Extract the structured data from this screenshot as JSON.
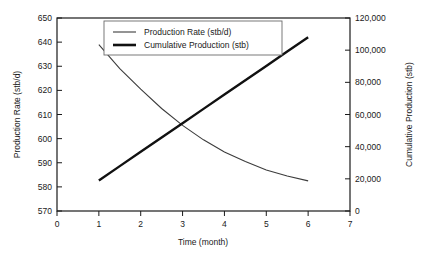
{
  "chart_data": {
    "type": "line",
    "title": "",
    "xlabel": "Time (month)",
    "ylabel": "Production Rate (stb/d)",
    "y2label": "Cumulative Production (stb)",
    "xlim": [
      0,
      7
    ],
    "ylim": [
      570,
      650
    ],
    "y2lim": [
      0,
      120000
    ],
    "grid": false,
    "legend_position": "top-center",
    "xticks": [
      "0",
      "1",
      "2",
      "3",
      "4",
      "5",
      "6",
      "7"
    ],
    "xtick_values": [
      0,
      1,
      2,
      3,
      4,
      5,
      6,
      7
    ],
    "yticks": [
      "570",
      "580",
      "590",
      "600",
      "610",
      "620",
      "630",
      "640",
      "650"
    ],
    "ytick_values": [
      570,
      580,
      590,
      600,
      610,
      620,
      630,
      640,
      650
    ],
    "y2ticks": [
      "0",
      "20,000",
      "40,000",
      "60,000",
      "80,000",
      "100,000",
      "120,000"
    ],
    "y2tick_values": [
      0,
      20000,
      40000,
      60000,
      80000,
      100000,
      120000
    ],
    "x": [
      1,
      1.5,
      2,
      2.5,
      3,
      3.5,
      4,
      4.5,
      5,
      5.5,
      6
    ],
    "series": [
      {
        "name": "Production Rate (stb/d)",
        "axis": "left",
        "line_width": "thin",
        "color": "#3c3c3c",
        "values": [
          639,
          629,
          620.5,
          612.5,
          605.5,
          599.5,
          594.5,
          590.5,
          587,
          584.5,
          582.5
        ]
      },
      {
        "name": "Cumulative Production (stb)",
        "axis": "right",
        "line_width": "thick",
        "color": "#111111",
        "values": [
          19000,
          27900,
          36800,
          45700,
          54600,
          63500,
          72400,
          81300,
          90200,
          99100,
          108000
        ]
      }
    ],
    "annotations": []
  },
  "legend": {
    "entries": [
      {
        "label": "Production Rate (stb/d)"
      },
      {
        "label": "Cumulative Production (stb)"
      }
    ]
  }
}
